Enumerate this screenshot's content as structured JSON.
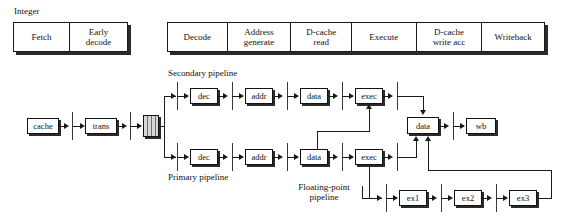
{
  "figure": {
    "integer_label": "Integer"
  },
  "stage_bar_left": {
    "cells": [
      {
        "label": "Fetch"
      },
      {
        "label": "Early\ndecode"
      }
    ]
  },
  "stage_bar_right": {
    "cells": [
      {
        "label": "Decode"
      },
      {
        "label": "Address\ngenerate"
      },
      {
        "label": "D-cache\nread"
      },
      {
        "label": "Execute"
      },
      {
        "label": "D-cache\nwrite acc"
      },
      {
        "label": "Writeback"
      }
    ]
  },
  "annotations": {
    "secondary_pipeline": "Secondary pipeline",
    "primary_pipeline": "Primary pipeline",
    "floating_point_pipeline": "Floating-point\npipeline"
  },
  "front_end": {
    "cache": "cache",
    "trans": "trans",
    "buffer": "instruction-buffer"
  },
  "secondary_pipeline": {
    "boxes": [
      {
        "label": "dec"
      },
      {
        "label": "addr"
      },
      {
        "label": "data"
      },
      {
        "label": "exec"
      }
    ]
  },
  "primary_pipeline": {
    "boxes": [
      {
        "label": "dec"
      },
      {
        "label": "addr"
      },
      {
        "label": "data"
      },
      {
        "label": "exec"
      }
    ]
  },
  "writeback_path": {
    "data": "data",
    "wb": "wb"
  },
  "floating_point_pipeline": {
    "boxes": [
      {
        "label": "ex1"
      },
      {
        "label": "ex2"
      },
      {
        "label": "ex3"
      }
    ]
  },
  "colors": {
    "line": "#1b1b1b",
    "box_border": "#121212",
    "shadow": "#2b2b2b",
    "buffer_fill": "#d8d8d8",
    "background": "#ffffff",
    "text": "#111111"
  }
}
